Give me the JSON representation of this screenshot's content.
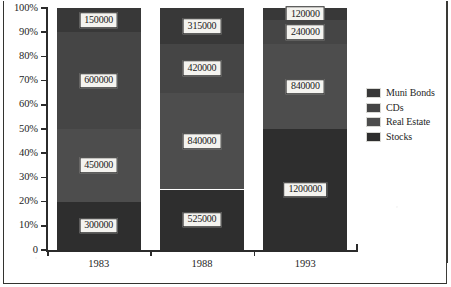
{
  "chart_data": {
    "type": "bar",
    "variant": "100% stacked column",
    "title": "",
    "subtitle": "",
    "xlabel": "",
    "ylabel": "",
    "categories": [
      "1983",
      "1988",
      "1993"
    ],
    "series": [
      {
        "name": "Stocks",
        "values": [
          300000,
          525000,
          1200000
        ],
        "color": "#2e2e2e",
        "stack_order": 1
      },
      {
        "name": "Real Estate",
        "values": [
          450000,
          840000,
          840000
        ],
        "color": "#4d4d4d",
        "stack_order": 2
      },
      {
        "name": "CDs",
        "values": [
          600000,
          420000,
          240000
        ],
        "color": "#454545",
        "stack_order": 3
      },
      {
        "name": "Muni Bonds",
        "values": [
          150000,
          315000,
          120000
        ],
        "color": "#383838",
        "stack_order": 4
      }
    ],
    "totals": [
      1500000,
      2100000,
      2400000
    ],
    "percent_stacks": [
      {
        "category": "1983",
        "Stocks": 20,
        "Real Estate": 30,
        "CDs": 40,
        "Muni Bonds": 10
      },
      {
        "category": "1988",
        "Stocks": 25,
        "Real Estate": 40,
        "CDs": 20,
        "Muni Bonds": 15
      },
      {
        "category": "1993",
        "Stocks": 50,
        "Real Estate": 35,
        "CDs": 10,
        "Muni Bonds": 5
      }
    ],
    "ylim": [
      0,
      100
    ],
    "yticks": [
      "0",
      "10%",
      "20%",
      "30%",
      "40%",
      "50%",
      "60%",
      "70%",
      "80%",
      "90%",
      "100%"
    ],
    "ytick_values": [
      0,
      10,
      20,
      30,
      40,
      50,
      60,
      70,
      80,
      90,
      100
    ],
    "grid": false,
    "legend_position": "right",
    "data_labels_shown": true
  },
  "axes": {
    "y": {
      "ticks": [
        {
          "label": "100%",
          "value": 100
        },
        {
          "label": "90%",
          "value": 90
        },
        {
          "label": "80%",
          "value": 80
        },
        {
          "label": "70%",
          "value": 70
        },
        {
          "label": "60%",
          "value": 60
        },
        {
          "label": "50%",
          "value": 50
        },
        {
          "label": "40%",
          "value": 40
        },
        {
          "label": "30%",
          "value": 30
        },
        {
          "label": "20%",
          "value": 20
        },
        {
          "label": "10%",
          "value": 10
        },
        {
          "label": "0",
          "value": 0
        }
      ]
    },
    "x": {
      "ticks": [
        {
          "label": "1983"
        },
        {
          "label": "1988"
        },
        {
          "label": "1993"
        }
      ]
    }
  },
  "bars": [
    {
      "category": "1983",
      "segments": [
        {
          "series": "Muni Bonds",
          "label": "150000",
          "percent": 10,
          "color": "#383838"
        },
        {
          "series": "CDs",
          "label": "600000",
          "percent": 40,
          "color": "#454545"
        },
        {
          "series": "Real Estate",
          "label": "450000",
          "percent": 30,
          "color": "#4d4d4d"
        },
        {
          "series": "Stocks",
          "label": "300000",
          "percent": 20,
          "color": "#2e2e2e"
        }
      ]
    },
    {
      "category": "1988",
      "segments": [
        {
          "series": "Muni Bonds",
          "label": "315000",
          "percent": 15,
          "color": "#383838"
        },
        {
          "series": "CDs",
          "label": "420000",
          "percent": 20,
          "color": "#454545"
        },
        {
          "series": "Real Estate",
          "label": "840000",
          "percent": 40,
          "color": "#4d4d4d"
        },
        {
          "series": "Stocks",
          "label": "525000",
          "percent": 25,
          "color": "#2e2e2e"
        }
      ]
    },
    {
      "category": "1993",
      "segments": [
        {
          "series": "Muni Bonds",
          "label": "120000",
          "percent": 5,
          "color": "#383838"
        },
        {
          "series": "CDs",
          "label": "240000",
          "percent": 10,
          "color": "#454545"
        },
        {
          "series": "Real Estate",
          "label": "840000",
          "percent": 35,
          "color": "#4d4d4d"
        },
        {
          "series": "Stocks",
          "label": "1200000",
          "percent": 50,
          "color": "#2e2e2e"
        }
      ]
    }
  ],
  "legend": {
    "items": [
      {
        "label": "Muni Bonds",
        "color": "#383838"
      },
      {
        "label": "CDs",
        "color": "#454545"
      },
      {
        "label": "Real Estate",
        "color": "#4d4d4d"
      },
      {
        "label": "Stocks",
        "color": "#2e2e2e"
      }
    ]
  }
}
